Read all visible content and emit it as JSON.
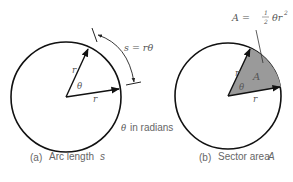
{
  "figure": {
    "panel_a": {
      "caption_tag": "(a)",
      "caption_text": "Arc length",
      "caption_var": "s",
      "radius_label_1": "r",
      "radius_label_2": "r",
      "angle_label": "θ",
      "arc_formula": "s = rθ",
      "unit_note_symbol": "θ",
      "unit_note_text": "in radians"
    },
    "panel_b": {
      "caption_tag": "(b)",
      "caption_text": "Sector area",
      "caption_var": "A",
      "radius_label_1": "r",
      "radius_label_2": "r",
      "angle_label": "θ",
      "area_label": "A",
      "area_formula_lhs": "A =",
      "area_formula_num": "1",
      "area_formula_den": "2",
      "area_formula_rhs": "θr",
      "area_formula_exp": "2"
    },
    "colors": {
      "stroke": "#111111",
      "sector_fill": "#9a9a9a",
      "text": "#666666"
    }
  }
}
